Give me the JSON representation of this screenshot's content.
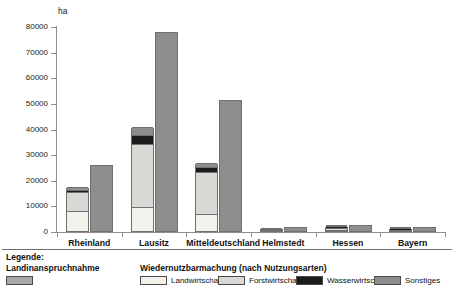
{
  "chart_data": {
    "type": "bar",
    "title": "",
    "subtitle": "",
    "xlabel": "",
    "ylabel": "ha",
    "ylim": [
      0,
      80000
    ],
    "ytick_values": [
      0,
      10000,
      20000,
      30000,
      40000,
      50000,
      60000,
      70000,
      80000
    ],
    "ytick_labels": [
      "0",
      "10000",
      "20000",
      "30000",
      "40000",
      "50000",
      "60000",
      "70000",
      "80000"
    ],
    "grid": false,
    "legend_position": "bottom",
    "categories": [
      "Rheinland",
      "Lausitz",
      "Mitteldeutschland",
      "Helmstedt",
      "Hessen",
      "Bayern"
    ],
    "series": [
      {
        "name": "Landinanspruchnahme",
        "stacked": false,
        "color": "#a8a8a8",
        "values": [
          17000,
          40500,
          26500,
          1100,
          2100,
          1300
        ]
      },
      {
        "name": "Wiedernutzbarmachung",
        "stacked": true,
        "color": "#8e8e8e",
        "values": [
          26000,
          78000,
          51500,
          2000,
          2900,
          2000
        ]
      }
    ],
    "stack_components": {
      "note": "Left bar of each pair is Landinanspruchnahme, stacked by Nutzungsart",
      "names": [
        "Landwirtschaft",
        "Forstwirtschaft",
        "Wasserwirtschaft",
        "Sonstiges"
      ],
      "colors": [
        "#f2f1ec",
        "#d8d8d4",
        "#1c1c1c",
        "#8e8e8e"
      ],
      "values": {
        "Rheinland": [
          8000,
          7300,
          900,
          800
        ],
        "Lausitz": [
          9500,
          24500,
          3500,
          3000
        ],
        "Mitteldeutschland": [
          6500,
          16500,
          1800,
          1700
        ],
        "Helmstedt": [
          300,
          450,
          200,
          150
        ],
        "Hessen": [
          500,
          800,
          500,
          300
        ],
        "Bayern": [
          200,
          300,
          600,
          200
        ]
      }
    }
  },
  "axis": {
    "unit_label": "ha"
  },
  "legend": {
    "title": "Legende:",
    "left_heading": "Landinanspruchnahme",
    "right_heading": "Wiedernutzbarmachung  (nach Nutzungsarten)",
    "items": [
      {
        "label": "Landwirtschaft",
        "color": "#f2f1ec"
      },
      {
        "label": "Forstwirtschaft",
        "color": "#d8d8d4"
      },
      {
        "label": "Wasserwirtschaft",
        "color": "#1c1c1c"
      },
      {
        "label": "Sonstiges",
        "color": "#8e8e8e"
      }
    ],
    "left_swatch_color": "#a8a8a8"
  }
}
